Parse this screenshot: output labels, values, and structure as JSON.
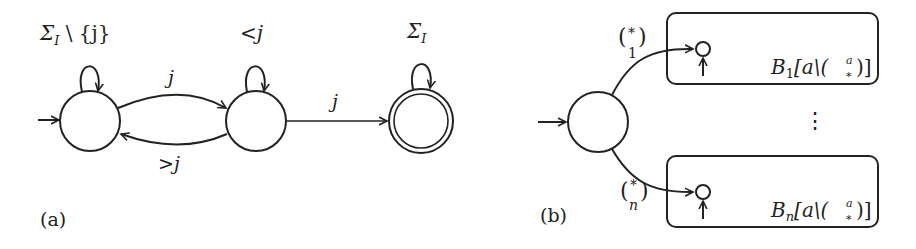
{
  "figure_a": {
    "caption": "(a)",
    "states": [
      {
        "id": "q0",
        "initial": true,
        "accepting": false,
        "self_loop_label": "Σ",
        "self_loop_sub": "I",
        "self_loop_suffix": " \\ {j}"
      },
      {
        "id": "q1",
        "initial": false,
        "accepting": false,
        "self_loop_label": "<j"
      },
      {
        "id": "q2",
        "initial": false,
        "accepting": true,
        "self_loop_label": "Σ",
        "self_loop_sub": "I"
      }
    ],
    "transitions": [
      {
        "from": "q0",
        "to": "q1",
        "label": "j"
      },
      {
        "from": "q1",
        "to": "q0",
        "label": ">j"
      },
      {
        "from": "q1",
        "to": "q2",
        "label": "j"
      }
    ]
  },
  "figure_b": {
    "caption": "(b)",
    "initial_state": {
      "id": "s0",
      "initial": true
    },
    "boxes": [
      {
        "id": "box-1",
        "edge_label_top": "*",
        "edge_label_bottom": "1",
        "name": "B",
        "sub": "1",
        "suffix": "[a\\(",
        "binom_top": "a",
        "binom_bottom": "*",
        "close": ")]"
      },
      {
        "id": "box-n",
        "edge_label_top": "*",
        "edge_label_bottom": "n",
        "name": "B",
        "sub": "n",
        "suffix": "[a\\(",
        "binom_top": "a",
        "binom_bottom": "*",
        "close": ")]"
      }
    ],
    "ellipsis": "⋮"
  }
}
